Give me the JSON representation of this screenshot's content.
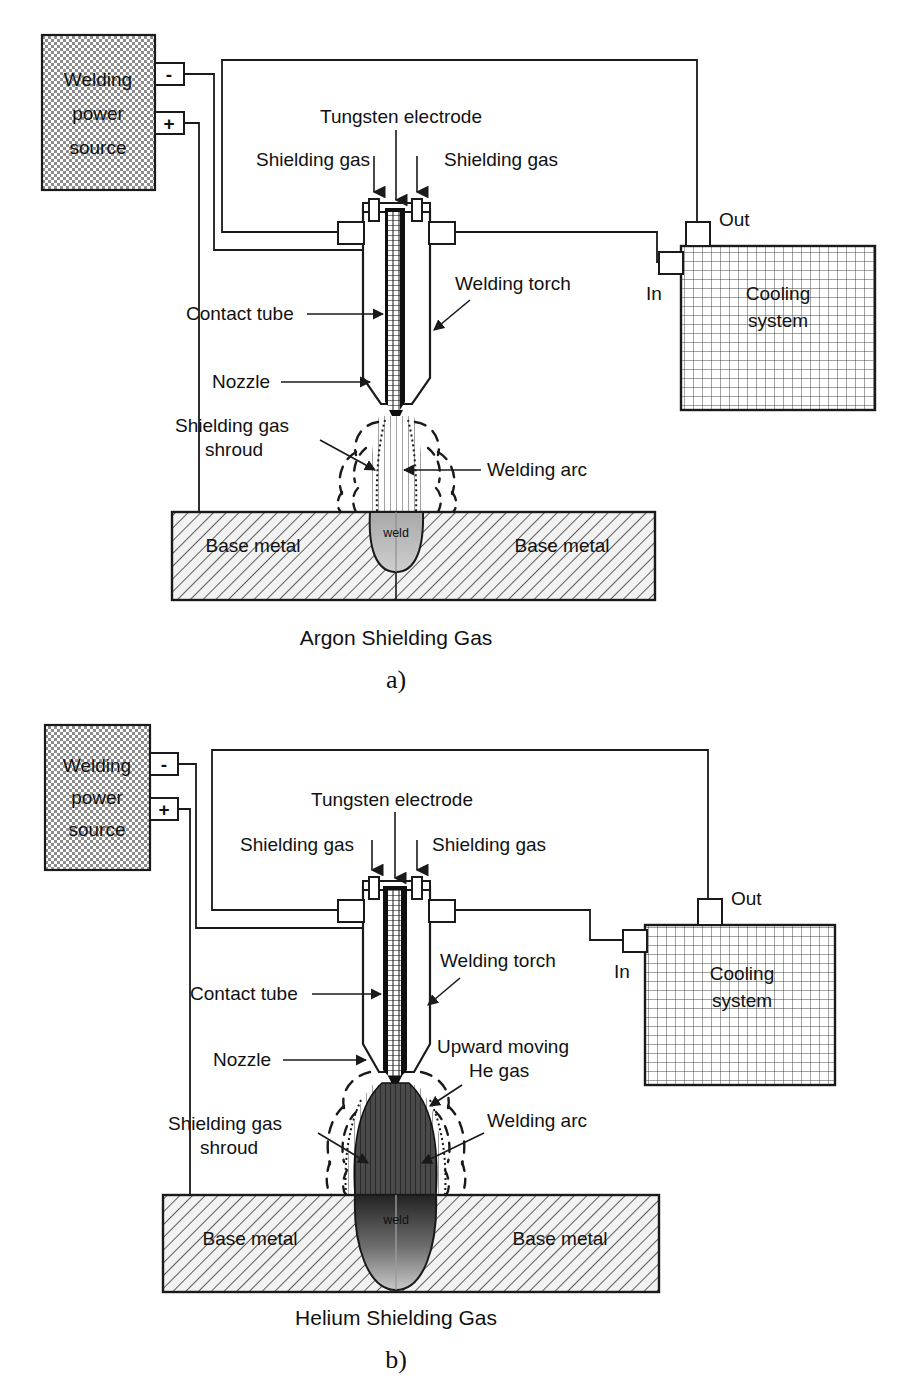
{
  "figure": {
    "colors": {
      "line": "#1a1a1a",
      "power_source_fill": "#b9b9b9",
      "cooling_fill": "#ffffff",
      "base_metal_fill": "#f0f0f0",
      "electrode_dark": "#101010",
      "weld_argon": "#b4b4b4",
      "weld_helium_dark": "#3a3a3a"
    }
  },
  "panels": [
    {
      "id": "a",
      "caption": "Argon Shielding Gas",
      "figure_letter": "a)",
      "power_source": {
        "label_lines": [
          "Welding",
          "power",
          "source"
        ],
        "terminals": [
          {
            "name": "negative-terminal",
            "symbol": "-"
          },
          {
            "name": "positive-terminal",
            "symbol": "+"
          }
        ]
      },
      "cooling_system": {
        "label_lines": [
          "Cooling",
          "system"
        ],
        "ports": [
          {
            "name": "out-port",
            "label": "Out"
          },
          {
            "name": "in-port",
            "label": "In"
          }
        ]
      },
      "callouts": [
        {
          "name": "tungsten-electrode",
          "text": "Tungsten electrode"
        },
        {
          "name": "shielding-gas-left",
          "text": "Shielding gas"
        },
        {
          "name": "shielding-gas-right",
          "text": "Shielding gas"
        },
        {
          "name": "welding-torch",
          "text": "Welding torch"
        },
        {
          "name": "contact-tube",
          "text": "Contact tube"
        },
        {
          "name": "nozzle",
          "text": "Nozzle"
        },
        {
          "name": "shielding-gas-shroud",
          "text": "Shielding gas shroud"
        },
        {
          "name": "welding-arc",
          "text": "Welding arc"
        }
      ],
      "shroud_label_lines": [
        "Shielding gas",
        "shroud"
      ],
      "base_metal_left": "Base metal",
      "base_metal_right": "Base metal",
      "weld_label": "weld"
    },
    {
      "id": "b",
      "caption": "Helium Shielding Gas",
      "figure_letter": "b)",
      "power_source": {
        "label_lines": [
          "Welding",
          "power",
          "source"
        ],
        "terminals": [
          {
            "name": "negative-terminal",
            "symbol": "-"
          },
          {
            "name": "positive-terminal",
            "symbol": "+"
          }
        ]
      },
      "cooling_system": {
        "label_lines": [
          "Cooling",
          "system"
        ],
        "ports": [
          {
            "name": "out-port",
            "label": "Out"
          },
          {
            "name": "in-port",
            "label": "In"
          }
        ]
      },
      "callouts": [
        {
          "name": "tungsten-electrode",
          "text": "Tungsten electrode"
        },
        {
          "name": "shielding-gas-left",
          "text": "Shielding gas"
        },
        {
          "name": "shielding-gas-right",
          "text": "Shielding gas"
        },
        {
          "name": "welding-torch",
          "text": "Welding torch"
        },
        {
          "name": "contact-tube",
          "text": "Contact tube"
        },
        {
          "name": "nozzle",
          "text": "Nozzle"
        },
        {
          "name": "shielding-gas-shroud",
          "text": "Shielding gas shroud"
        },
        {
          "name": "welding-arc",
          "text": "Welding arc"
        },
        {
          "name": "upward-moving-he-gas",
          "text": "Upward moving He gas"
        }
      ],
      "shroud_label_lines": [
        "Shielding gas",
        "shroud"
      ],
      "he_label_lines": [
        "Upward moving",
        "He gas"
      ],
      "base_metal_left": "Base metal",
      "base_metal_right": "Base metal",
      "weld_label": "weld"
    }
  ]
}
